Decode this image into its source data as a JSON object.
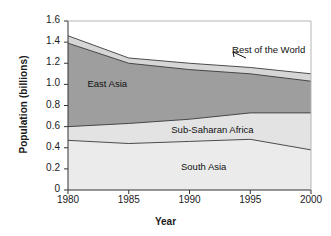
{
  "chart_data": {
    "type": "area",
    "stacked": true,
    "title": "",
    "xlabel": "Year",
    "ylabel": "Population (billions)",
    "x": [
      1980,
      1985,
      1990,
      1995,
      2000
    ],
    "xticklabels": [
      "1980",
      "1985",
      "1990",
      "1995",
      "2000"
    ],
    "xlim": [
      1980,
      2000
    ],
    "ylim": [
      0,
      1.6
    ],
    "yticks": [
      0,
      0.2,
      0.4,
      0.6,
      0.8,
      1.0,
      1.2,
      1.4,
      1.6
    ],
    "yticklabels": [
      "0",
      "0.2",
      "0.4",
      "0.6",
      "0.8",
      "1.0",
      "1.2",
      "1.4",
      "1.6"
    ],
    "grid": false,
    "legend": "inline-labels",
    "series": [
      {
        "name": "South Asia",
        "label": "South Asia",
        "color": "#ebebeb",
        "values": [
          0.47,
          0.44,
          0.46,
          0.48,
          0.38
        ],
        "cumulative": [
          0.47,
          0.44,
          0.46,
          0.48,
          0.38
        ]
      },
      {
        "name": "Sub-Saharan Africa",
        "label": "Sub-Saharan Africa",
        "color": "#e3e3e3",
        "values": [
          0.13,
          0.19,
          0.21,
          0.25,
          0.35
        ],
        "cumulative": [
          0.6,
          0.63,
          0.67,
          0.73,
          0.73
        ]
      },
      {
        "name": "East Asia",
        "label": "East Asia",
        "color": "#9e9e9e",
        "values": [
          0.79,
          0.57,
          0.47,
          0.37,
          0.3
        ],
        "cumulative": [
          1.39,
          1.2,
          1.14,
          1.1,
          1.03
        ]
      },
      {
        "name": "Rest of the World",
        "label": "Rest of the World",
        "color": "#d6d6d6",
        "values": [
          0.07,
          0.05,
          0.06,
          0.06,
          0.07
        ],
        "cumulative": [
          1.46,
          1.25,
          1.2,
          1.16,
          1.1
        ]
      }
    ],
    "annotations": [
      {
        "text": "East Asia",
        "x": 1981.6,
        "y": 1.0
      },
      {
        "text": "Sub-Saharan Africa",
        "x": 1988.5,
        "y": 0.57
      },
      {
        "text": "South Asia",
        "x": 1989.3,
        "y": 0.22
      },
      {
        "text": "Rest of the World",
        "x": 1993.5,
        "y": 1.33,
        "leader": true
      }
    ]
  },
  "axes": {
    "y_title": "Population (billions)",
    "x_title": "Year"
  }
}
